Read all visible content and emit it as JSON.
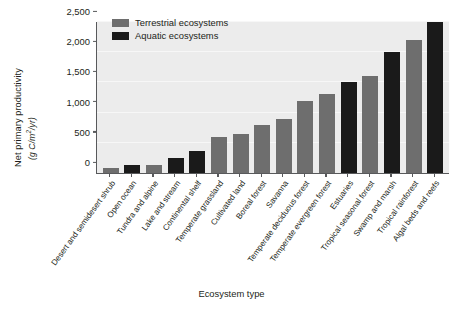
{
  "chart_data": {
    "type": "bar",
    "title": "",
    "xlabel": "Ecosystem type",
    "ylabel": "Net primary productivity",
    "ylabel_units": "(g C/m2/yr)",
    "ylim": [
      0,
      2500
    ],
    "yticks": [
      "0",
      "500",
      "1,000",
      "1,500",
      "2,000",
      "2,500"
    ],
    "ytick_values": [
      0,
      500,
      1000,
      1500,
      2000,
      2500
    ],
    "grid": true,
    "legend_position": "top-left",
    "categories": [
      "Desert and semidesert shrub",
      "Open ocean",
      "Tundra and alpine",
      "Lake and stream",
      "Continental shelf",
      "Temperate grassland",
      "Cultivated land",
      "Boreal forest",
      "Savanna",
      "Temperate deciduous forest",
      "Temperate evergreen forest",
      "Estuaries",
      "Tropical seasonal forest",
      "Swamp and marsh",
      "Tropical rainforest",
      "Algal beds and reefs"
    ],
    "values": [
      90,
      125,
      140,
      250,
      360,
      600,
      650,
      800,
      900,
      1200,
      1300,
      1500,
      1600,
      2000,
      2200,
      2500
    ],
    "groups": [
      "terrestrial",
      "aquatic",
      "terrestrial",
      "aquatic",
      "aquatic",
      "terrestrial",
      "terrestrial",
      "terrestrial",
      "terrestrial",
      "terrestrial",
      "terrestrial",
      "aquatic",
      "terrestrial",
      "aquatic",
      "terrestrial",
      "aquatic"
    ],
    "series": [
      {
        "name": "Terrestrial ecosystems",
        "color": "#6e6e6e"
      },
      {
        "name": "Aquatic ecosystems",
        "color": "#1a1a1a"
      }
    ]
  },
  "legend": {
    "items": [
      {
        "label": "Terrestrial ecosystems",
        "color": "#6e6e6e"
      },
      {
        "label": "Aquatic ecosystems",
        "color": "#1a1a1a"
      }
    ]
  },
  "axes": {
    "y_title": "Net primary productivity",
    "y_units": "(g C/m",
    "y_units_sup": "2",
    "y_units_tail": "/yr)",
    "x_title": "Ecosystem type"
  },
  "colors": {
    "plot_background": "#ececec",
    "gridline": "#f7f7f7",
    "axis": "#58595b",
    "terrestrial": "#6e6e6e",
    "aquatic": "#1a1a1a",
    "text": "#231f20",
    "page_background": "#ffffff"
  }
}
